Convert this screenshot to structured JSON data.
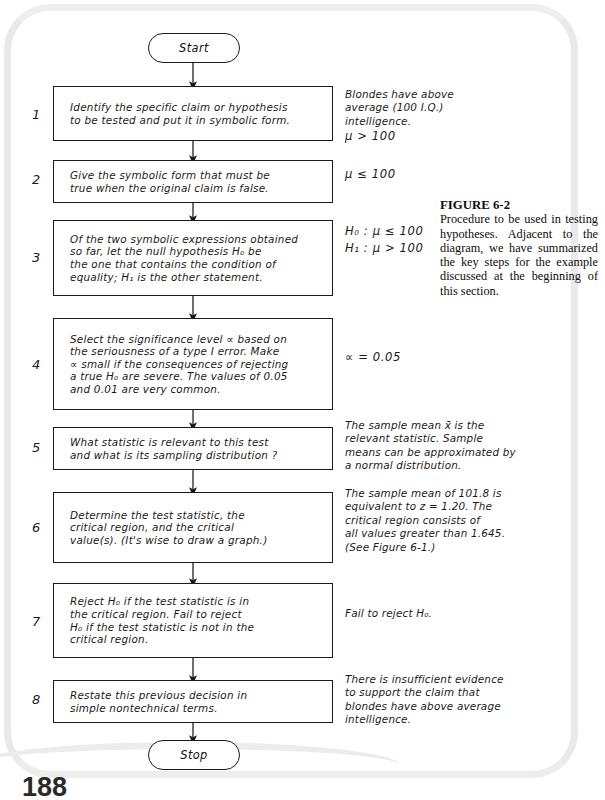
{
  "figure": {
    "title": "FIGURE 6-2",
    "caption": "Procedure to be used in testing hypotheses. Adjacent to the diagram, we have summarized the key steps for the example discussed at the beginning of this section."
  },
  "page_number": "188",
  "terminators": {
    "start": "Start",
    "stop": "Stop"
  },
  "steps": [
    {
      "number": "1",
      "text": "Identify the specific claim or hypothesis\nto be tested and put it in symbolic form.",
      "annotation": "Blondes have above\naverage (100 I.Q.)\nintelligence.",
      "annotation_math": "μ > 100"
    },
    {
      "number": "2",
      "text": "Give the symbolic form that must be\ntrue when the original claim is false.",
      "annotation": "",
      "annotation_math": "μ ≤ 100"
    },
    {
      "number": "3",
      "text": "Of the two symbolic expressions obtained\nso far, let the null hypothesis H₀ be\nthe one that contains the condition of\nequality; H₁ is the other statement.",
      "annotation": "",
      "annotation_math": "H₀ : μ ≤ 100\nH₁ : μ > 100"
    },
    {
      "number": "4",
      "text": "Select the significance level ∝ based on\nthe seriousness of a type I error. Make\n∝ small if the consequences of rejecting\na true H₀ are severe. The values of 0.05\nand 0.01 are very common.",
      "annotation": "",
      "annotation_math": "∝ = 0.05"
    },
    {
      "number": "5",
      "text": "What statistic is relevant to this test\nand what is its sampling distribution ?",
      "annotation": "The sample mean x̄ is the\nrelevant statistic. Sample\nmeans can be approximated by\na normal distribution.",
      "annotation_math": ""
    },
    {
      "number": "6",
      "text": "Determine the test statistic, the\ncritical region, and the critical\nvalue(s).  (It's wise to draw a graph.)",
      "annotation": "The sample mean of 101.8 is\nequivalent to z = 1.20. The\ncritical region consists of\nall values greater than 1.645.\n(See Figure 6-1.)",
      "annotation_math": ""
    },
    {
      "number": "7",
      "text": "Reject H₀ if the test statistic is in\nthe critical region. Fail to reject\nH₀ if the test statistic is not in the\ncritical region.",
      "annotation": "Fail to reject H₀.",
      "annotation_math": ""
    },
    {
      "number": "8",
      "text": "Restate this previous decision in\nsimple nontechnical terms.",
      "annotation": "There is insufficient evidence\nto support the claim that\nblondes have above average\nintelligence.",
      "annotation_math": ""
    }
  ]
}
